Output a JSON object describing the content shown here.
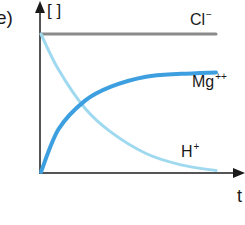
{
  "panel": {
    "label": "e)"
  },
  "chart_data": {
    "type": "line",
    "title": "",
    "panel_label": "e)",
    "ylabel": "[ ]",
    "xlabel": "t",
    "grid": false,
    "legend": "inline labels",
    "axis_ranges": {
      "x": [
        0,
        1
      ],
      "y": [
        0,
        1
      ]
    },
    "series": [
      {
        "name": "Cl⁻",
        "label_base": "Cl",
        "label_sup": "−",
        "color": "#8a8a8a",
        "shape": "constant",
        "x": [
          0,
          1
        ],
        "y": [
          0.97,
          0.97
        ]
      },
      {
        "name": "Mg⁺⁺",
        "label_base": "Mg",
        "label_sup": "++",
        "color": "#3d9fe0",
        "shape": "rising, saturating",
        "x": [
          0,
          0.1,
          0.25,
          0.4,
          0.6,
          0.8,
          1.0
        ],
        "y": [
          0,
          0.3,
          0.5,
          0.6,
          0.67,
          0.69,
          0.7
        ]
      },
      {
        "name": "H⁺",
        "label_base": "H",
        "label_sup": "+",
        "color": "#9fd9f0",
        "shape": "exponential decay",
        "x": [
          0,
          0.1,
          0.25,
          0.4,
          0.6,
          0.8,
          1.0
        ],
        "y": [
          0.97,
          0.72,
          0.45,
          0.28,
          0.13,
          0.05,
          0.01
        ]
      }
    ]
  }
}
